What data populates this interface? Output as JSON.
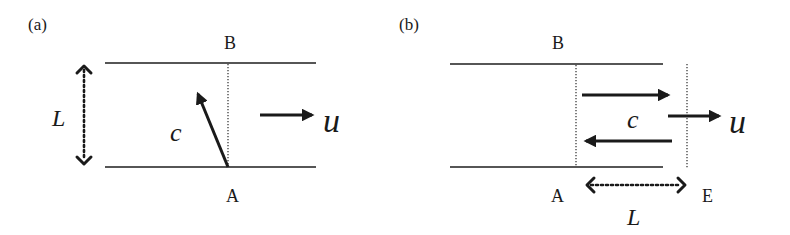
{
  "panels": [
    {
      "id": "a",
      "label": "(a)",
      "top_point": "B",
      "bottom_point": "A",
      "distance_label": "L",
      "wave_speed_label": "c",
      "flow_speed_label": "u",
      "description": "Channel between two walls; vector c points from A diagonally upstream toward the top wall; flow u to the right; L is the wall separation"
    },
    {
      "id": "b",
      "label": "(b)",
      "top_point": "B",
      "bottom_point": "A",
      "end_point": "E",
      "distance_label": "L",
      "wave_speed_label": "c",
      "flow_speed_label": "u",
      "description": "Channel with two vertical dotted lines at A and E; rightward and leftward c arrows between them; flow u to the right; L is the distance from A to E"
    }
  ],
  "colors": {
    "ink": "#1a1a1a",
    "background": "#ffffff"
  }
}
